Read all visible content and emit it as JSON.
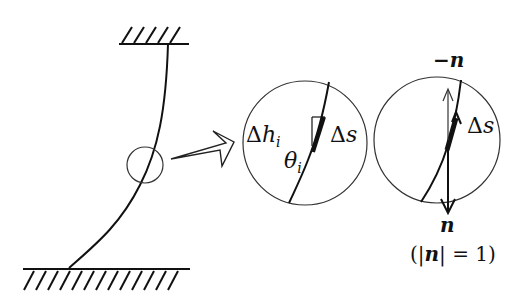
{
  "diagram": {
    "type": "mechanics-beam-detail",
    "colors": {
      "stroke": "#111111",
      "thin_stroke": "#333333",
      "background": "#ffffff"
    },
    "left_panel": {
      "description": "Curved elastic beam fixed between top and bottom walls, with a small circle marking an element",
      "top_support": {
        "x1": 119,
        "x2": 189,
        "y": 44
      },
      "bottom_support": {
        "x1": 23,
        "x2": 190,
        "y": 269
      },
      "marker_circle": {
        "cx": 145,
        "cy": 165,
        "r": 18
      }
    },
    "zoom_arrow": {
      "label": ""
    },
    "middle_panel": {
      "circle": {
        "cx": 305,
        "cy": 143,
        "r": 62
      },
      "labels": {
        "dh_delta": "Δ",
        "dh_var": "h",
        "dh_sub": "i",
        "ds_delta": "Δ",
        "ds_var": "s",
        "theta_var": "θ",
        "theta_sub": "i"
      }
    },
    "right_panel": {
      "circle": {
        "cx": 437,
        "cy": 140,
        "r": 63
      },
      "labels": {
        "neg_n": "−n",
        "ds_delta": "Δ",
        "ds_var": "s",
        "n": "n",
        "norm_open": "(",
        "norm_bar_l": "|",
        "norm_var": "n",
        "norm_bar_r": "|",
        "norm_eq": " = 1",
        "norm_close": ")"
      }
    }
  }
}
